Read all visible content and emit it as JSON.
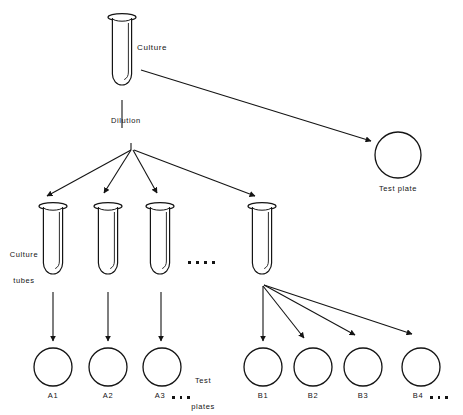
{
  "figure": {
    "type": "diagram",
    "background_color": "#ffffff",
    "line_color": "#141414"
  },
  "labels": {
    "culture": "Culture",
    "dilution": "Dilution",
    "test_plate": "Test plate",
    "culture_tubes_line1": "Culture",
    "culture_tubes_line2": "tubes",
    "test_plates_line1": "Test",
    "test_plates_line2": "plates",
    "ellipsis": "...."
  },
  "nodes": {
    "culture_tube": {
      "id": "culture",
      "label": "Culture",
      "cx": 122,
      "top": 14,
      "bottom": 100
    },
    "dilution_node": {
      "id": "dilution",
      "label": "Dilution",
      "x": 131,
      "y": 143
    },
    "test_plate_top": {
      "id": "test-plate",
      "label": "Test plate",
      "cx": 398,
      "cy": 155,
      "r": 23
    }
  },
  "culture_tubes": [
    {
      "id": "tube-1",
      "cx": 53,
      "top": 203,
      "bottom": 278
    },
    {
      "id": "tube-2",
      "cx": 108,
      "top": 203,
      "bottom": 278
    },
    {
      "id": "tube-3",
      "cx": 160,
      "top": 203,
      "bottom": 278
    },
    {
      "id": "tube-4",
      "cx": 262,
      "top": 203,
      "bottom": 278
    }
  ],
  "plates_row_a": [
    {
      "id": "plate-a1",
      "label": "A1",
      "cx": 53,
      "cy": 367,
      "r": 19
    },
    {
      "id": "plate-a2",
      "label": "A2",
      "cx": 108,
      "cy": 367,
      "r": 19
    },
    {
      "id": "plate-a3",
      "label": "A3",
      "cx": 162,
      "cy": 367,
      "r": 19
    }
  ],
  "plates_row_a_suffix": "A3 ...",
  "plates_row_b": [
    {
      "id": "plate-b1",
      "label": "B1",
      "cx": 263,
      "cy": 367,
      "r": 19
    },
    {
      "id": "plate-b2",
      "label": "B2",
      "cx": 313,
      "cy": 367,
      "r": 19
    },
    {
      "id": "plate-b3",
      "label": "B3",
      "cx": 363,
      "cy": 367,
      "r": 19
    },
    {
      "id": "plate-b4",
      "label": "B4",
      "cx": 421,
      "cy": 367,
      "r": 19
    }
  ],
  "plate_labels": {
    "a1": "A1",
    "a2": "A2",
    "a3": "A3",
    "a3_dots": "...",
    "b1": "B1",
    "b2": "B2",
    "b3": "B3",
    "b4": "B4",
    "b4_dots": "..."
  }
}
